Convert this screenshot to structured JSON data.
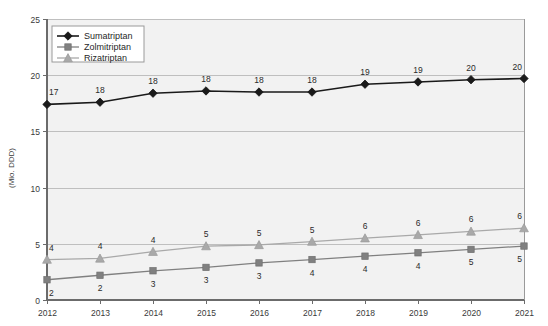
{
  "chart_data": {
    "type": "line",
    "title": "",
    "subtitle": "",
    "xlabel": "",
    "ylabel": "(Mio. DDD)",
    "categories": [
      "2012",
      "2013",
      "2014",
      "2015",
      "2016",
      "2017",
      "2018",
      "2019",
      "2020",
      "2021"
    ],
    "x": [
      2012,
      2013,
      2014,
      2015,
      2016,
      2017,
      2018,
      2019,
      2020,
      2021
    ],
    "ylim": [
      0,
      25
    ],
    "xlim": [
      2012,
      2021
    ],
    "yticks": [
      "0",
      "5",
      "10",
      "15",
      "20",
      "25"
    ],
    "ytick_values": [
      0,
      5,
      10,
      15,
      20,
      25
    ],
    "grid": "horizontal",
    "legend_position": "top-left",
    "series": [
      {
        "name": "Sumatriptan",
        "marker": "diamond",
        "color": "#1a1a1a",
        "values": [
          17.4,
          17.6,
          18.4,
          18.6,
          18.5,
          18.5,
          19.2,
          19.4,
          19.6,
          19.7
        ],
        "labels": [
          "17",
          "18",
          "18",
          "18",
          "18",
          "18",
          "19",
          "19",
          "20",
          "20"
        ]
      },
      {
        "name": "Zolmitriptan",
        "marker": "square",
        "color": "#808080",
        "values": [
          1.8,
          2.2,
          2.6,
          2.9,
          3.3,
          3.6,
          3.9,
          4.2,
          4.5,
          4.8
        ],
        "labels": [
          "2",
          "2",
          "3",
          "3",
          "3",
          "4",
          "4",
          "4",
          "5",
          "5"
        ]
      },
      {
        "name": "Rizatriptan",
        "marker": "triangle",
        "color": "#a9a9a9",
        "values": [
          3.6,
          3.7,
          4.3,
          4.8,
          4.9,
          5.2,
          5.5,
          5.8,
          6.1,
          6.4
        ],
        "labels": [
          "4",
          "4",
          "4",
          "5",
          "5",
          "5",
          "6",
          "6",
          "6",
          "6"
        ]
      }
    ]
  },
  "legend": {
    "items": [
      {
        "label": "Sumatriptan"
      },
      {
        "label": "Zolmitriptan"
      },
      {
        "label": "Rizatriptan"
      }
    ]
  },
  "axis": {
    "y_title": "(Mio. DDD)"
  },
  "colors": {
    "sumatriptan": "#1a1a1a",
    "zolmitriptan": "#808080",
    "rizatriptan": "#a9a9a9",
    "plot_background": "#f2f2f2",
    "gridline": "#bfbfbf",
    "axis": "#6b6b6b",
    "page_background": "#ffffff"
  }
}
